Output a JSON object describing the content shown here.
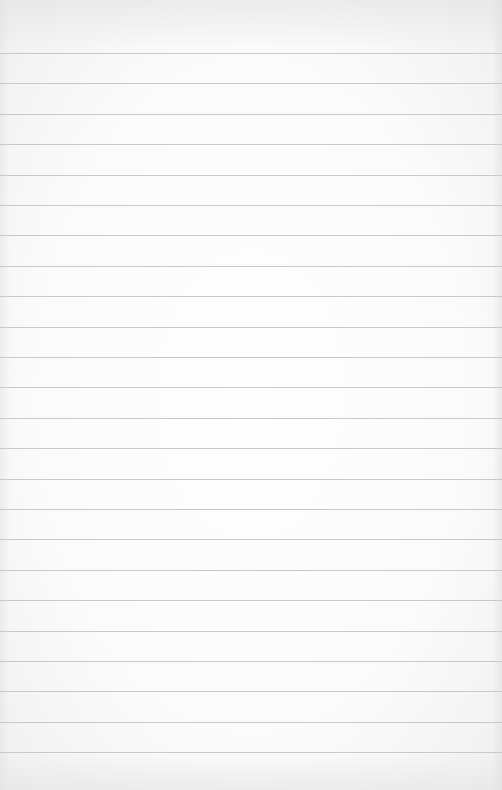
{
  "page": {
    "type": "lined-paper",
    "background_color": "#fbfbfb",
    "rule_color": "#c9c9c9",
    "rule_count": 24,
    "first_rule_y": 53,
    "rule_spacing": 30.4
  },
  "text": []
}
